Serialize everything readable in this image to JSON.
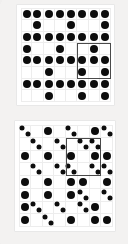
{
  "figure": {
    "background_color": "#f3f2f1",
    "dot_color": "#0d0d0d",
    "grid_line_color": "#ededed",
    "highlight_border_color": "#4a4a4a",
    "panel_background": "#ffffff"
  },
  "panels": [
    {
      "name": "top-panel",
      "label": "Top grid",
      "rows": 8,
      "cols": 8,
      "cell_kind_legend": {
        "0": "empty",
        "1": "single-large-dot"
      },
      "cells": [
        [
          1,
          1,
          1,
          1,
          1,
          1,
          1,
          1
        ],
        [
          0,
          1,
          0,
          0,
          1,
          0,
          0,
          1
        ],
        [
          1,
          1,
          1,
          1,
          1,
          1,
          1,
          1
        ],
        [
          1,
          0,
          0,
          1,
          0,
          0,
          1,
          0
        ],
        [
          1,
          1,
          1,
          1,
          1,
          1,
          1,
          1
        ],
        [
          0,
          0,
          1,
          0,
          0,
          1,
          0,
          1
        ],
        [
          1,
          1,
          1,
          1,
          1,
          1,
          1,
          1
        ],
        [
          0,
          0,
          1,
          0,
          0,
          1,
          0,
          1
        ]
      ],
      "dot_count": 46,
      "highlight": {
        "label": "highlighted 3x3 region",
        "start_row": 3,
        "start_col": 5,
        "rows": 3,
        "cols": 3
      }
    },
    {
      "name": "bottom-panel",
      "label": "Bottom grid",
      "rows": 8,
      "cols": 8,
      "cell_kind_legend": {
        "0": "empty",
        "1": "single-large-dot",
        "2": "diagonal-dot-pair"
      },
      "cells": [
        [
          2,
          0,
          1,
          0,
          2,
          0,
          1,
          2
        ],
        [
          0,
          2,
          0,
          2,
          0,
          2,
          2,
          0
        ],
        [
          1,
          0,
          1,
          0,
          1,
          0,
          1,
          1
        ],
        [
          0,
          2,
          0,
          2,
          2,
          0,
          2,
          2
        ],
        [
          1,
          0,
          1,
          0,
          1,
          1,
          0,
          1
        ],
        [
          1,
          0,
          1,
          0,
          1,
          2,
          0,
          2
        ],
        [
          1,
          2,
          0,
          2,
          0,
          2,
          1,
          0
        ],
        [
          1,
          0,
          2,
          0,
          1,
          0,
          1,
          1
        ]
      ],
      "dot_count": 58,
      "highlight": {
        "label": "highlighted 3x3 region",
        "start_row": 1,
        "start_col": 4,
        "rows": 3,
        "cols": 3
      }
    }
  ]
}
